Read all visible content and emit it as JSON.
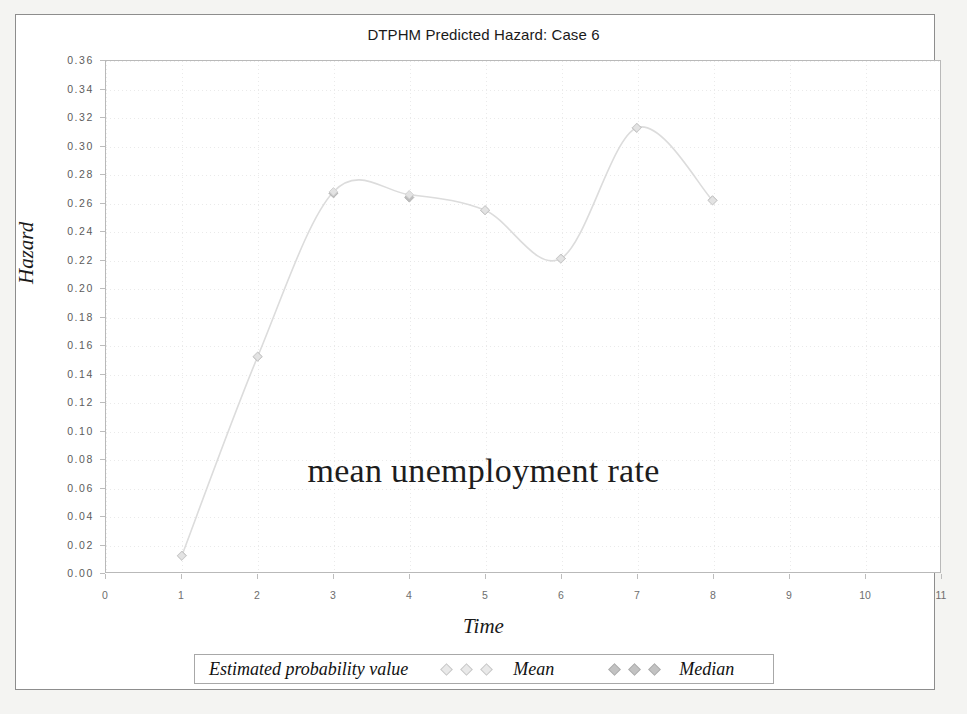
{
  "chart_data": {
    "type": "line",
    "title": "DTPHM Predicted Hazard: Case 6",
    "xlabel": "Time",
    "ylabel": "Hazard",
    "annotation": "mean unemployment rate",
    "xlim": [
      0,
      11
    ],
    "ylim": [
      0.0,
      0.36
    ],
    "xticks": [
      "0",
      "1",
      "2",
      "3",
      "4",
      "5",
      "6",
      "7",
      "8",
      "9",
      "10",
      "11"
    ],
    "yticks": [
      "0.36",
      "0.34",
      "0.32",
      "0.30",
      "0.28",
      "0.26",
      "0.24",
      "0.22",
      "0.20",
      "0.18",
      "0.16",
      "0.14",
      "0.12",
      "0.10",
      "0.08",
      "0.06",
      "0.04",
      "0.02",
      "0.00"
    ],
    "grid": true,
    "legend_position": "bottom",
    "x": [
      1,
      2,
      3,
      4,
      5,
      6,
      7,
      8
    ],
    "series": [
      {
        "name": "Mean",
        "marker": "diamond-open",
        "color": "#e3e3e3",
        "values": [
          0.012,
          0.152,
          0.268,
          0.266,
          0.255,
          0.221,
          0.313,
          0.262
        ]
      },
      {
        "name": "Median",
        "marker": "diamond-filled",
        "color": "#bdbdbd",
        "values": [
          0.012,
          0.152,
          0.267,
          0.264,
          0.255,
          0.221,
          0.313,
          0.262
        ]
      }
    ],
    "line_color": "#dcdcdc",
    "curve_peak_1": {
      "x": 3.35,
      "y": 0.277
    },
    "curve_trough": {
      "x": 6.0,
      "y": 0.221
    },
    "curve_peak_2": {
      "x": 7.0,
      "y": 0.313
    }
  },
  "legend": {
    "series_label": "Estimated probability value",
    "mean_label": "Mean",
    "median_label": "Median"
  }
}
